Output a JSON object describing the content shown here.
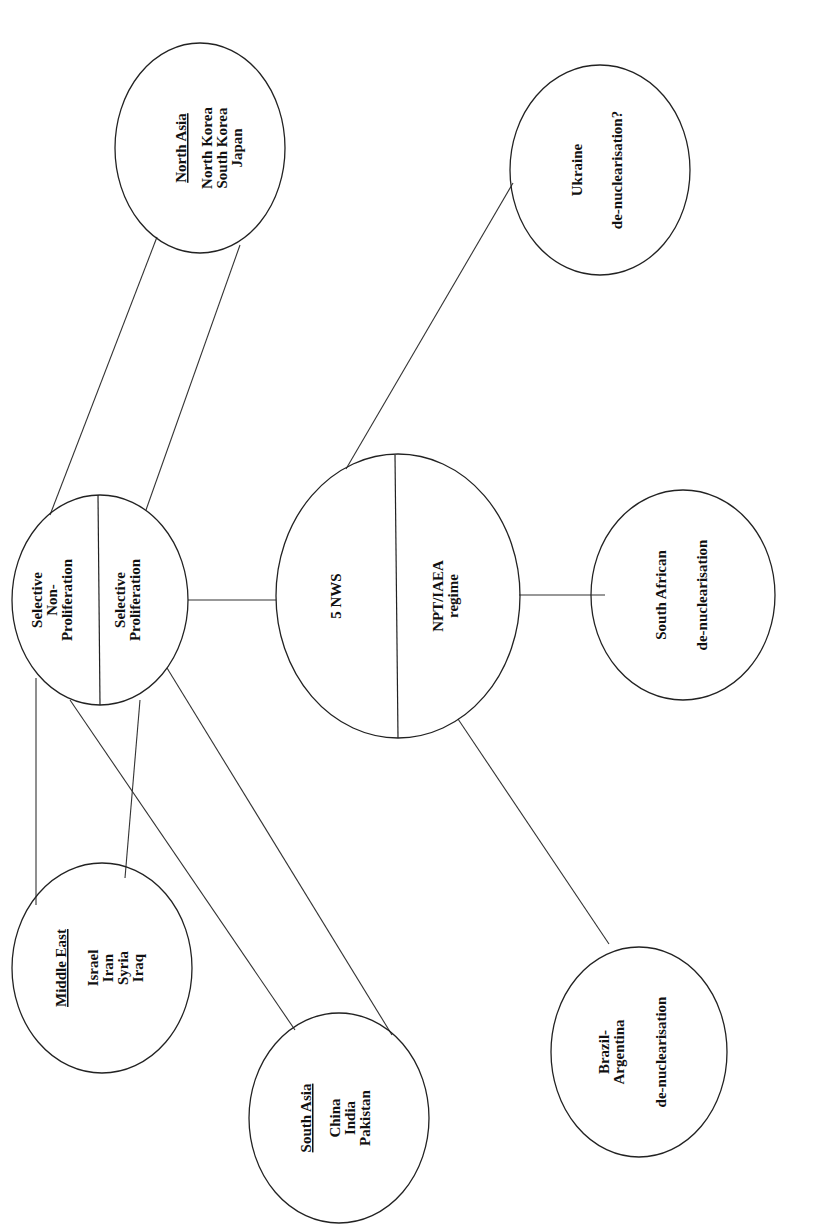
{
  "diagram": {
    "orientation": "rotated -90deg (text reads bottom-to-top)",
    "nodes": {
      "north_asia": {
        "heading": "North Asia",
        "items": [
          "North Korea",
          "South Korea",
          "Japan"
        ]
      },
      "ukraine": {
        "line1": "Ukraine",
        "line2": "de-nuclearisation?"
      },
      "selective": {
        "left": {
          "line1": "Selective",
          "line2": "Non-",
          "line3": "Proliferation"
        },
        "right": {
          "line1": "Selective",
          "line2": "Proliferation"
        }
      },
      "nws": {
        "left": {
          "line1": "5 NWS"
        },
        "right": {
          "line1": "NPT/IAEA",
          "line2": "regime"
        }
      },
      "south_africa": {
        "line1": "South African",
        "line2": "de-nuclearisation"
      },
      "middle_east": {
        "heading": "Middle East",
        "items": [
          "Israel",
          "Iran",
          "Syria",
          "Iraq"
        ]
      },
      "south_asia": {
        "heading": "South Asia",
        "items": [
          "China",
          "India",
          "Pakistan"
        ]
      },
      "brazil_argentina": {
        "line1": "Brazil-",
        "line2": "Argentina",
        "line3": "de-nuclearisation"
      }
    },
    "edges": [
      [
        "selective",
        "north_asia"
      ],
      [
        "selective",
        "north_asia"
      ],
      [
        "selective",
        "nws"
      ],
      [
        "selective",
        "middle_east"
      ],
      [
        "selective",
        "middle_east"
      ],
      [
        "selective",
        "south_asia"
      ],
      [
        "selective",
        "south_asia"
      ],
      [
        "nws",
        "ukraine"
      ],
      [
        "nws",
        "south_africa"
      ],
      [
        "nws",
        "brazil_argentina"
      ]
    ]
  }
}
